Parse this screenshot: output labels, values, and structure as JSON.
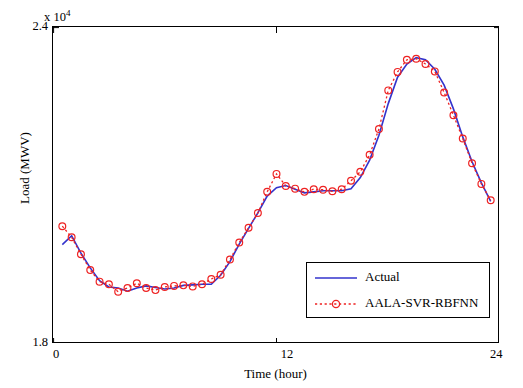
{
  "chart_data": {
    "type": "line",
    "title": "",
    "xlabel": "Time (hour)",
    "ylabel": "Load (MWV)",
    "y_multiplier_base": "x 10",
    "y_multiplier_exp": "4",
    "xlim": [
      0,
      24
    ],
    "ylim": [
      18000,
      24000
    ],
    "yticks": [
      18000,
      24000
    ],
    "ytick_labels": [
      "1.8",
      "2.4"
    ],
    "xticks": [
      0,
      12,
      24
    ],
    "xtick_labels": [
      "0",
      "12",
      "24"
    ],
    "grid": false,
    "legend_position": "lower right",
    "series": [
      {
        "name": "Actual",
        "color": "#3333cc",
        "style": "solid",
        "marker": "none",
        "x": [
          0.5,
          1.0,
          1.5,
          2.0,
          2.5,
          3.0,
          3.5,
          4.0,
          4.5,
          5.0,
          5.5,
          6.0,
          6.5,
          7.0,
          7.5,
          8.0,
          8.5,
          9.0,
          9.5,
          10.0,
          10.5,
          11.0,
          11.5,
          12.0,
          12.5,
          13.0,
          13.5,
          14.0,
          14.5,
          15.0,
          15.5,
          16.0,
          16.5,
          17.0,
          17.5,
          18.0,
          18.5,
          19.0,
          19.5,
          20.0,
          20.5,
          21.0,
          21.5,
          22.0,
          22.5,
          23.0,
          23.5
        ],
        "y": [
          19880,
          20050,
          19720,
          19440,
          19200,
          19080,
          19060,
          19000,
          19060,
          19100,
          19070,
          19040,
          19060,
          19110,
          19120,
          19130,
          19130,
          19300,
          19560,
          19890,
          20190,
          20480,
          20800,
          20960,
          21000,
          20930,
          20860,
          20880,
          20900,
          20900,
          20900,
          20940,
          21150,
          21480,
          21950,
          22550,
          23050,
          23300,
          23420,
          23380,
          23200,
          22900,
          22450,
          21920,
          21450,
          21050,
          20700
        ]
      },
      {
        "name": "AALA-SVR-RBFNN",
        "color": "#ee2222",
        "style": "dotted",
        "marker": "circle",
        "x": [
          0.5,
          1.0,
          1.5,
          2.0,
          2.5,
          3.0,
          3.5,
          4.0,
          4.5,
          5.0,
          5.5,
          6.0,
          6.5,
          7.0,
          7.5,
          8.0,
          8.5,
          9.0,
          9.5,
          10.0,
          10.5,
          11.0,
          11.5,
          12.0,
          12.5,
          13.0,
          13.5,
          14.0,
          14.5,
          15.0,
          15.5,
          16.0,
          16.5,
          17.0,
          17.5,
          18.0,
          18.5,
          19.0,
          19.5,
          20.0,
          20.5,
          21.0,
          21.5,
          22.0,
          22.5,
          23.0,
          23.5
        ],
        "y": [
          20230,
          20020,
          19700,
          19400,
          19180,
          19130,
          18990,
          19060,
          19150,
          19060,
          19020,
          19080,
          19100,
          19110,
          19090,
          19130,
          19230,
          19310,
          19600,
          19920,
          20200,
          20480,
          20880,
          21220,
          20990,
          20940,
          20880,
          20930,
          20920,
          20890,
          20930,
          21090,
          21260,
          21580,
          22070,
          22800,
          23150,
          23380,
          23400,
          23300,
          23160,
          22760,
          22330,
          21890,
          21420,
          21030,
          20720
        ]
      }
    ]
  },
  "axes": {
    "x_title": "Time (hour)",
    "y_title": "Load (MWV)",
    "y_mult_base": "x 10",
    "y_mult_exp": "4",
    "ytick_top": "2.4",
    "ytick_bottom": "1.8",
    "xtick_0": "0",
    "xtick_12": "12",
    "xtick_24": "24"
  },
  "legend": {
    "items": [
      {
        "label": "Actual",
        "color": "#3333cc"
      },
      {
        "label": "AALA-SVR-RBFNN",
        "color": "#ee2222"
      }
    ]
  }
}
